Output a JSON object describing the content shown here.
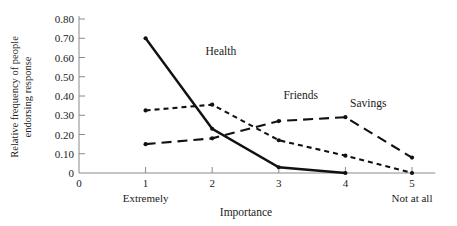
{
  "chart_data": {
    "type": "line",
    "title": "",
    "xlabel": "Importance",
    "ylabel": "Relative frequency of people endorsing response",
    "ylabel_line1": "Relative frequency of people",
    "ylabel_line2": "endorsing response",
    "x": [
      1,
      2,
      3,
      4,
      5
    ],
    "categories": [
      "1",
      "2",
      "3",
      "4",
      "5"
    ],
    "xlim": [
      0,
      5.35
    ],
    "ylim": [
      0,
      0.8
    ],
    "xticks": [
      "0",
      "1",
      "2",
      "3",
      "4",
      "5"
    ],
    "xtick_values": [
      0,
      1,
      2,
      3,
      4,
      5
    ],
    "yticks": [
      "0",
      "0.10",
      "0.20",
      "0.30",
      "0.40",
      "0.50",
      "0.60",
      "0.70",
      "0.80"
    ],
    "ytick_values": [
      0,
      0.1,
      0.2,
      0.3,
      0.4,
      0.5,
      0.6,
      0.7,
      0.8
    ],
    "x_axis_end_labels": {
      "left": "Extremely",
      "left_at": 1,
      "right": "Not at all",
      "right_at": 5
    },
    "grid": false,
    "legend_position": "inline-annotations",
    "series": [
      {
        "name": "Health",
        "style": "solid",
        "markers": true,
        "x": [
          1,
          2,
          3,
          4
        ],
        "values": [
          0.7,
          0.23,
          0.03,
          0.0
        ],
        "label_x": 1.9,
        "label_y": 0.615
      },
      {
        "name": "Friends",
        "style": "short-dash",
        "markers": true,
        "x": [
          1,
          2,
          3,
          4,
          5
        ],
        "values": [
          0.325,
          0.355,
          0.17,
          0.09,
          0.0
        ],
        "label_x": 3.07,
        "label_y": 0.385
      },
      {
        "name": "Savings",
        "style": "long-dash",
        "markers": true,
        "x": [
          1,
          2,
          3,
          4,
          5
        ],
        "values": [
          0.15,
          0.18,
          0.27,
          0.29,
          0.08
        ],
        "label_x": 4.07,
        "label_y": 0.345
      }
    ],
    "colors": {
      "line": "#111111",
      "axis": "#8a8a8a",
      "text": "#1a1a1a",
      "background": "#ffffff"
    }
  }
}
